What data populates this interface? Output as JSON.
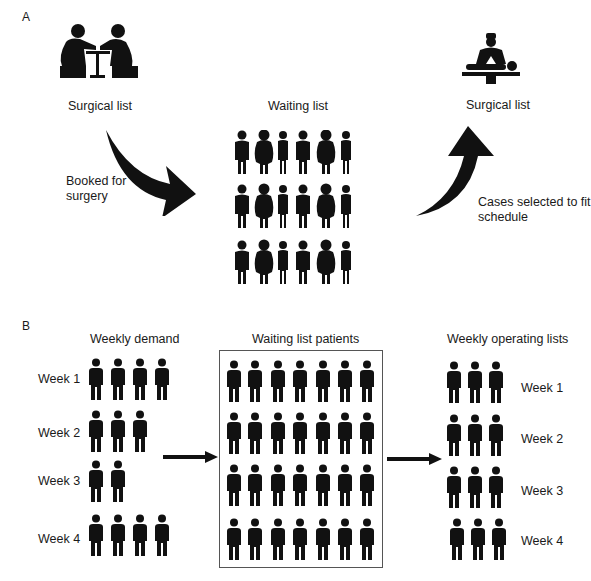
{
  "panel_a": {
    "letter": "A",
    "labels": {
      "surgical_list_left": "Surgical list",
      "waiting_list": "Waiting list",
      "surgical_list_right": "Surgical list",
      "booked": [
        "Booked for",
        "surgery"
      ],
      "cases_selected": [
        "Cases selected to fit",
        "schedule"
      ]
    },
    "icons": {
      "consultation": "consultation-icon",
      "surgeon": "surgeon-operating-icon"
    },
    "waiting_grid": {
      "rows": 3,
      "cols": 6
    }
  },
  "panel_b": {
    "letter": "B",
    "headers": {
      "weekly_demand": "Weekly demand",
      "waiting_patients": "Waiting list patients",
      "weekly_operating": "Weekly operating lists"
    },
    "weekly_demand": [
      {
        "label": "Week 1",
        "count": 4
      },
      {
        "label": "Week 2",
        "count": 3
      },
      {
        "label": "Week 3",
        "count": 2
      },
      {
        "label": "Week 4",
        "count": 4
      }
    ],
    "waiting_grid": {
      "rows": 4,
      "cols": 7
    },
    "weekly_operating": [
      {
        "label": "Week 1",
        "count": 3
      },
      {
        "label": "Week 2",
        "count": 3
      },
      {
        "label": "Week 3",
        "count": 3
      },
      {
        "label": "Week 4",
        "count": 3
      }
    ]
  },
  "colors": {
    "figure": "#111111",
    "text": "#1a1a1a",
    "border": "#555555"
  }
}
